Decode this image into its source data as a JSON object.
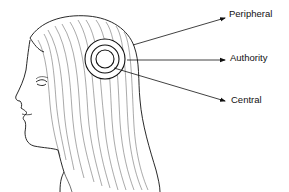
{
  "diagram": {
    "labels": [
      {
        "id": "peripheral",
        "text": "Peripheral"
      },
      {
        "id": "authority",
        "text": "Authority"
      },
      {
        "id": "central",
        "text": "Central"
      }
    ],
    "circles": [
      {
        "ring": "outer",
        "label": "Peripheral"
      },
      {
        "ring": "middle",
        "label": "Authority"
      },
      {
        "ring": "inner",
        "label": "Central"
      }
    ],
    "colors": {
      "line": "#111111",
      "background": "#ffffff"
    }
  }
}
